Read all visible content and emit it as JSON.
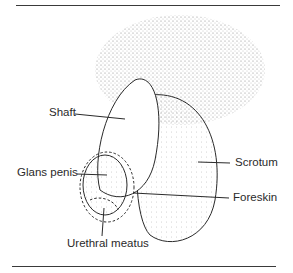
{
  "figure": {
    "labels": {
      "shaft": "Shaft",
      "glans": "Glans penis",
      "scrotum": "Scrotum",
      "foreskin": "Foreskin",
      "meatus": "Urethral meatus"
    },
    "colors": {
      "ink": "#2a2a2a",
      "stipple": "#6a6a6a",
      "rule": "#3a3a3a"
    }
  }
}
